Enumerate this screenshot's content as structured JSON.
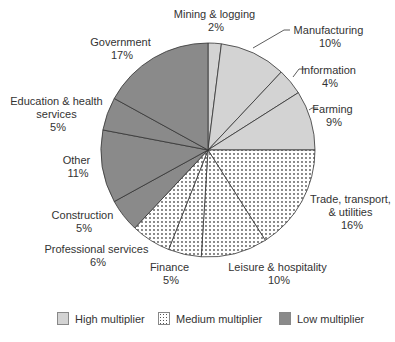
{
  "chart_data": {
    "type": "pie",
    "title": "",
    "start_angle": "12 o'clock",
    "direction": "clockwise",
    "slices": [
      {
        "label": "Mining & logging",
        "value": 2,
        "pct_label": "2%",
        "group": "high"
      },
      {
        "label": "Manufacturing",
        "value": 10,
        "pct_label": "10%",
        "group": "high"
      },
      {
        "label": "Information",
        "value": 4,
        "pct_label": "4%",
        "group": "high"
      },
      {
        "label": "Farming",
        "value": 9,
        "pct_label": "9%",
        "group": "high"
      },
      {
        "label": "Trade, transport, & utilities",
        "value": 16,
        "pct_label": "16%",
        "group": "medium"
      },
      {
        "label": "Leisure & hospitality",
        "value": 10,
        "pct_label": "10%",
        "group": "medium"
      },
      {
        "label": "Finance",
        "value": 5,
        "pct_label": "5%",
        "group": "medium"
      },
      {
        "label": "Professional services",
        "value": 6,
        "pct_label": "6%",
        "group": "medium"
      },
      {
        "label": "Construction",
        "value": 5,
        "pct_label": "5%",
        "group": "low"
      },
      {
        "label": "Other",
        "value": 11,
        "pct_label": "11%",
        "group": "low"
      },
      {
        "label": "Education & health services",
        "value": 5,
        "pct_label": "5%",
        "group": "low"
      },
      {
        "label": "Government",
        "value": 17,
        "pct_label": "17%",
        "group": "low"
      }
    ],
    "legend": [
      {
        "key": "high",
        "label": "High multiplier",
        "color": "#d3d3d3",
        "pattern": "solid"
      },
      {
        "key": "medium",
        "label": "Medium multiplier",
        "color": "#ffffff",
        "pattern": "dots"
      },
      {
        "key": "low",
        "label": "Low multiplier",
        "color": "#8a8a8a",
        "pattern": "solid"
      }
    ],
    "legend_position": "bottom"
  },
  "labels": {
    "mining": [
      "Mining & logging",
      "2%"
    ],
    "manufacturing": [
      "Manufacturing",
      "10%"
    ],
    "information": [
      "Information",
      "4%"
    ],
    "farming": [
      "Farming",
      "9%"
    ],
    "trade": [
      "Trade, transport,",
      "& utilities",
      "16%"
    ],
    "leisure": [
      "Leisure & hospitality",
      "10%"
    ],
    "finance": [
      "Finance",
      "5%"
    ],
    "professional": [
      "Professional services",
      "6%"
    ],
    "construction": [
      "Construction",
      "5%"
    ],
    "other": [
      "Other",
      "11%"
    ],
    "education": [
      "Education & health",
      "services",
      "5%"
    ],
    "government": [
      "Government",
      "17%"
    ]
  },
  "legend": {
    "high": "High multiplier",
    "medium": "Medium multiplier",
    "low": "Low multiplier"
  },
  "colors": {
    "high": "#d3d3d3",
    "low": "#8a8a8a",
    "dot": "#555555",
    "stroke": "#333333"
  }
}
